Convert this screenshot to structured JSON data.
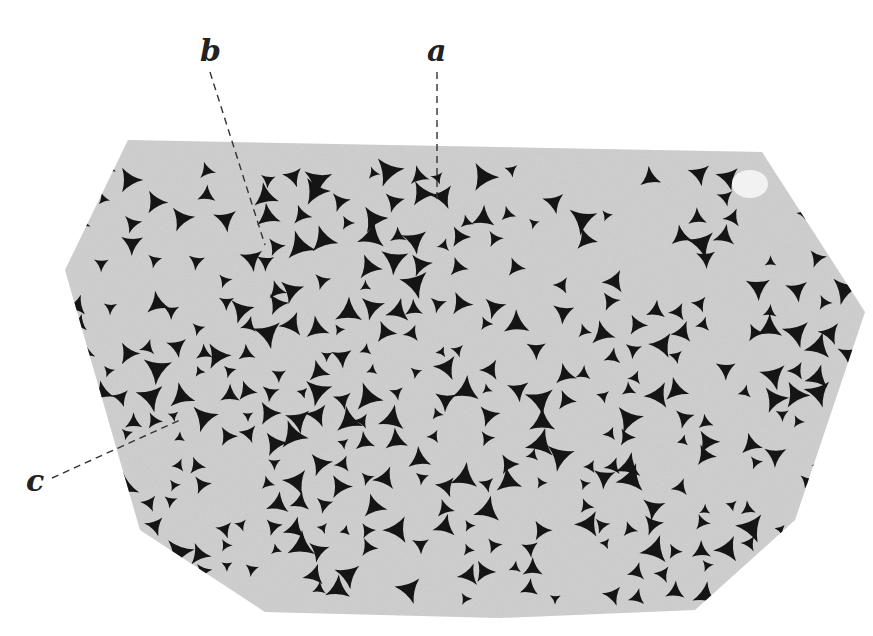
{
  "figure": {
    "background_color": "#ffffff",
    "section_color": "#c9c9c9",
    "grain_color": "#d2d2d2",
    "interstice_color": "#151515",
    "labels": [
      {
        "id": "a",
        "text": "a",
        "x": 427,
        "y": 40,
        "line_to": [
          437,
          200
        ]
      },
      {
        "id": "b",
        "text": "b",
        "x": 200,
        "y": 40,
        "line_to": [
          265,
          245
        ]
      },
      {
        "id": "c",
        "text": "c",
        "x": 26,
        "y": 476,
        "line_to": [
          180,
          420
        ]
      }
    ]
  }
}
